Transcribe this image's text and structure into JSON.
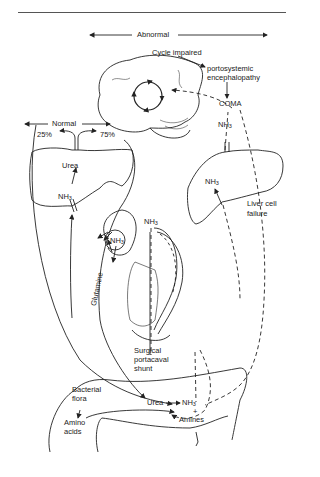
{
  "figure": {
    "type": "ammonia metabolism pathway diagram",
    "sections": {
      "abnormal_label": "Abnormal",
      "normal_label": "Normal"
    },
    "brain": {
      "cycle_label": "Cycle impaired",
      "condition": "portosystemic encephalopathy",
      "outcome": "COMA"
    },
    "normal_liver": {
      "split_left": "25%",
      "split_right": "75%",
      "product": "Urea",
      "input": "NH",
      "input_sub": "3"
    },
    "kidney": {
      "compound": "NH",
      "compound_sub": "3",
      "transport_label": "Glutamine"
    },
    "failing_liver": {
      "nh3_top": "NH",
      "nh3_top_sub": "3",
      "nh3_inner": "NH",
      "nh3_inner_sub": "3",
      "label_line1": "Liver cell",
      "label_line2": "failure"
    },
    "shunt": {
      "nh3": "NH",
      "nh3_sub": "3",
      "label_line1": "Surgical",
      "label_line2": "portacaval",
      "label_line3": "shunt"
    },
    "gut": {
      "bacteria_line1": "Bacterial",
      "bacteria_line2": "flora",
      "amino_line1": "Amino",
      "amino_line2": "acids",
      "urea": "Urea",
      "nh3": "NH",
      "nh3_sub": "3",
      "plus": "+",
      "amines": "Amines"
    }
  }
}
